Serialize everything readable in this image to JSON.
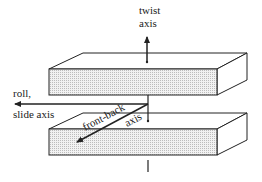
{
  "diagram": {
    "type": "3d-axes-illustration",
    "colors": {
      "stroke": "#222222",
      "face_fill": "#e6e6e6",
      "top_fill": "#ffffff",
      "background": "#ffffff"
    },
    "blocks": [
      {
        "id": "upper-block",
        "label": ""
      },
      {
        "id": "lower-block",
        "label": ""
      }
    ],
    "axes": {
      "twist": {
        "line1": "twist",
        "line2": "axis",
        "direction": "up"
      },
      "roll": {
        "line1": "roll,",
        "line2": "slide axis",
        "direction": "left"
      },
      "front_back": {
        "line1": "front-back",
        "line2": "axis",
        "direction": "front-left"
      }
    }
  }
}
